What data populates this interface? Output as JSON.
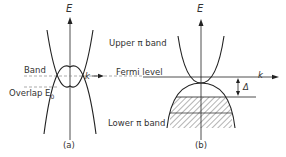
{
  "panel_a": {
    "axis_y_label": "E",
    "axis_x_label": "k",
    "label_band": "Band",
    "label_overlap": "Overlap E",
    "label_overlap_sub": "0",
    "caption": "(a)"
  },
  "panel_b": {
    "axis_y_label": "E",
    "axis_x_label": "k",
    "label_upper": "Upper π band",
    "label_fermi": "Fermi level",
    "label_lower": "Lower π band",
    "label_gap": "Δ",
    "caption": "(b)"
  },
  "colors": {
    "line": "#222222",
    "text": "#333333",
    "dashed": "#888888"
  }
}
